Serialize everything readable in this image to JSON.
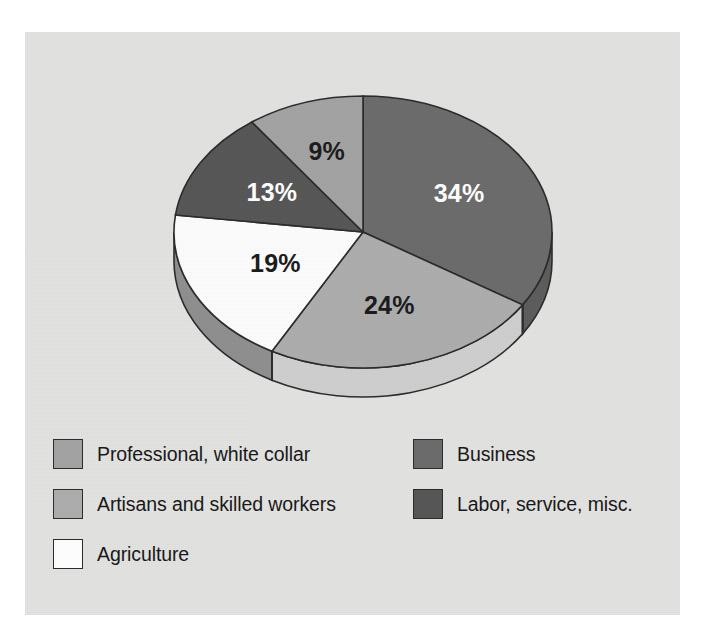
{
  "chart_data": {
    "type": "pie",
    "title": "",
    "subtitle": "",
    "xlabel": "",
    "ylabel": "",
    "legend_position": "bottom",
    "grid": false,
    "start_angle_deg": 0,
    "direction": "clockwise",
    "three_d": true,
    "categories": [
      "Professional, white collar",
      "Business",
      "Artisans and skilled workers",
      "Labor, service, misc.",
      "Agriculture"
    ],
    "values": [
      34,
      24,
      19,
      13,
      9
    ],
    "slices": [
      {
        "id": "business",
        "label": "Business",
        "value": 34,
        "value_label": "34%",
        "color": "#6b6b6b",
        "side_color": "#5c5c5c",
        "label_color": "#ffffff",
        "start_deg": 0,
        "end_deg": 122.4
      },
      {
        "id": "artisans",
        "label": "Artisans and skilled workers",
        "value": 24,
        "value_label": "24%",
        "color": "#adadad",
        "side_color": "#cfcfcf",
        "label_color": "#1a1a1a",
        "start_deg": 122.4,
        "end_deg": 208.8
      },
      {
        "id": "agriculture",
        "label": "Agriculture",
        "value": 19,
        "value_label": "19%",
        "color": "#fdfdfd",
        "side_color": "#8f8f8f",
        "label_color": "#1a1a1a",
        "start_deg": 208.8,
        "end_deg": 277.2
      },
      {
        "id": "labor",
        "label": "Labor, service, misc.",
        "value": 13,
        "value_label": "13%",
        "color": "#565656",
        "side_color": "#4a4a4a",
        "label_color": "#ffffff",
        "start_deg": 277.2,
        "end_deg": 324.0
      },
      {
        "id": "professional",
        "label": "Professional, white collar",
        "value": 9,
        "value_label": "9%",
        "color": "#a3a3a3",
        "side_color": "#909090",
        "label_color": "#1a1a1a",
        "start_deg": 324.0,
        "end_deg": 360.0
      }
    ],
    "labels": {
      "business": "34%",
      "artisans": "24%",
      "agriculture": "19%",
      "labor": "13%",
      "professional": "9%"
    }
  },
  "legend": {
    "left_column": [
      {
        "label": "Professional, white collar",
        "color": "#a3a3a3"
      },
      {
        "label": "Artisans and skilled workers",
        "color": "#adadad"
      },
      {
        "label": "Agriculture",
        "color": "#ffffff"
      }
    ],
    "right_column": [
      {
        "label": "Business",
        "color": "#6b6b6b"
      },
      {
        "label": "Labor, service, misc.",
        "color": "#565656"
      }
    ]
  },
  "colors": {
    "panel_background": "#e3e3e1",
    "page_background": "#ffffff",
    "outline": "#2b2b2b",
    "text": "#171717"
  }
}
